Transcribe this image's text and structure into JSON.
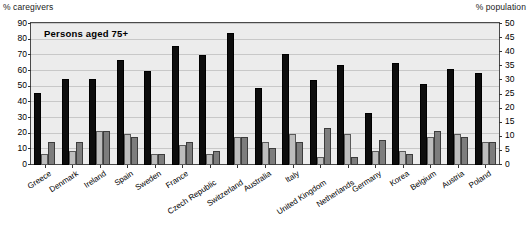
{
  "axis": {
    "left_caption": "% caregivers",
    "right_caption": "% population",
    "left_ticks": [
      "90",
      "80",
      "70",
      "60",
      "50",
      "40",
      "30",
      "20",
      "10",
      "0"
    ],
    "right_ticks": [
      "50",
      "45",
      "40",
      "35",
      "30",
      "25",
      "20",
      "15",
      "10",
      "5",
      "0"
    ]
  },
  "plot": {
    "title": "Persons aged 75+"
  },
  "chart_data": {
    "type": "bar",
    "title": "Persons aged 75+",
    "xlabel": "",
    "ylabel": "% caregivers",
    "y2label": "% population",
    "ylim": [
      0,
      90
    ],
    "y2lim": [
      0,
      50
    ],
    "grid": true,
    "legend": "none",
    "categories": [
      "Greece",
      "Denmark",
      "Ireland",
      "Spain",
      "Sweden",
      "France",
      "Czech Republic",
      "Switzerland",
      "Australia",
      "Italy",
      "United Kingdom",
      "Netherlands",
      "Germany",
      "Korea",
      "Belgium",
      "Austria",
      "Poland"
    ],
    "series": [
      {
        "name": "% caregivers",
        "axis": "left",
        "color": "#0d0d0d",
        "values": [
          46,
          55,
          55,
          67,
          60,
          76,
          70,
          84,
          49,
          71,
          54,
          64,
          33,
          65,
          52,
          61,
          59
        ]
      },
      {
        "name": "% population (light)",
        "axis": "right",
        "color": "#bdbdbd",
        "values": [
          4,
          5,
          12,
          11,
          4,
          7,
          4,
          10,
          8,
          11,
          3,
          11,
          5,
          5,
          10,
          11,
          8
        ]
      },
      {
        "name": "% population (dark)",
        "axis": "right",
        "color": "#7d7d7d",
        "values": [
          8,
          8,
          12,
          10,
          4,
          8,
          5,
          10,
          6,
          8,
          13,
          3,
          9,
          4,
          12,
          10,
          8
        ]
      }
    ]
  }
}
